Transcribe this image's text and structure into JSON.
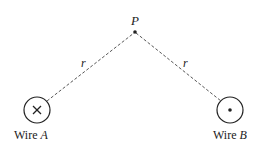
{
  "diagram": {
    "point": {
      "label": "P"
    },
    "distance_label_left": "r",
    "distance_label_right": "r",
    "wire_a": {
      "label_prefix": "Wire ",
      "label_letter": "A",
      "symbol": "into-page (×)"
    },
    "wire_b": {
      "label_prefix": "Wire ",
      "label_letter": "B",
      "symbol": "out-of-page (•)"
    },
    "colors": {
      "line": "#333333",
      "background": "#ffffff"
    }
  }
}
